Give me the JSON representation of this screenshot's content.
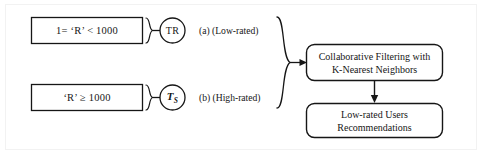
{
  "figure": {
    "background_color": "#ffffff",
    "stroke_color": "#161616",
    "frame_color": "#f2f2f2"
  },
  "branches": [
    {
      "id": "low",
      "condition": "1= ‘R’ < 1000",
      "node_symbol": "TR",
      "label": "(a) (Low-rated)"
    },
    {
      "id": "high",
      "condition": "‘R’ ≥ 1000",
      "node_symbol_base": "T",
      "node_symbol_sub": "S",
      "label": "(b) (High-rated)"
    }
  ],
  "process": {
    "filtering_line1": "Collaborative Filtering with",
    "filtering_line2": "K-Nearest Neighbors",
    "output_line1": "Low-rated Users",
    "output_line2": "Recommendations"
  }
}
